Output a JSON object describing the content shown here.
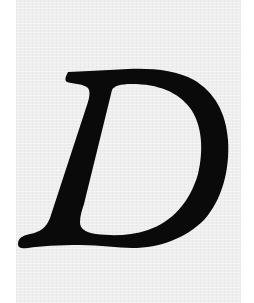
{
  "image": {
    "letter": "D",
    "style": "italic serif",
    "colors": {
      "letter": "#0a0a0a",
      "background": "#eeeeee",
      "margin": "#ffffff"
    }
  }
}
